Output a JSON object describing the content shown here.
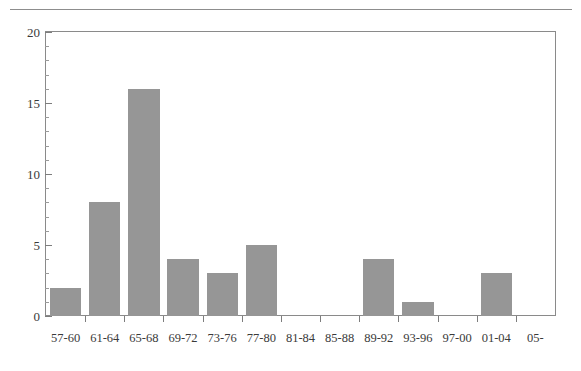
{
  "figure": {
    "background_color": "#ffffff",
    "rule_color": "#8d8d8d",
    "frame_color": "#8a8a8a",
    "bar_color": "#969696",
    "text_color": "#3a3a3a"
  },
  "chart_data": {
    "type": "bar",
    "title": "",
    "subtitle": "",
    "xlabel": "",
    "ylabel": "",
    "categories": [
      "57-60",
      "61-64",
      "65-68",
      "69-72",
      "73-76",
      "77-80",
      "81-84",
      "85-88",
      "89-92",
      "93-96",
      "97-00",
      "01-04",
      "05-"
    ],
    "values": [
      2,
      8,
      16,
      4,
      3,
      5,
      0,
      0,
      4,
      1,
      0,
      3,
      0
    ],
    "ylim": [
      0,
      20
    ],
    "xlim_categories": 13,
    "y_major_ticks": [
      0,
      5,
      10,
      15,
      20
    ],
    "y_tick_labels": [
      "0",
      "5",
      "10",
      "15",
      "20"
    ],
    "y_minor_tick_interval": 1,
    "grid": false,
    "legend": null,
    "legend_position": "none",
    "annotations": []
  }
}
